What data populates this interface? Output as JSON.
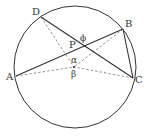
{
  "diagram": {
    "type": "inscribed-angle-geometry",
    "circle": {
      "cx": 75,
      "cy": 67,
      "r": 61
    },
    "center": {
      "x": 74,
      "y": 67
    },
    "points": [
      {
        "name": "D",
        "x": 41,
        "y": 17,
        "label": "D",
        "lx": 32,
        "ly": 15
      },
      {
        "name": "B",
        "x": 123,
        "y": 29,
        "label": "B",
        "lx": 125,
        "ly": 27
      },
      {
        "name": "A",
        "x": 16,
        "y": 76,
        "label": "A",
        "lx": 6,
        "ly": 80
      },
      {
        "name": "C",
        "x": 133,
        "y": 78,
        "label": "C",
        "lx": 135,
        "ly": 83
      },
      {
        "name": "P",
        "x": 81,
        "y": 46,
        "label": "P",
        "lx": 69,
        "ly": 48
      }
    ],
    "solid_lines": [
      [
        "D",
        "C"
      ],
      [
        "A",
        "B"
      ],
      [
        "B",
        "C"
      ]
    ],
    "dashed_lines": [
      [
        "D",
        "O"
      ],
      [
        "B",
        "O"
      ],
      [
        "A",
        "O"
      ],
      [
        "C",
        "O"
      ]
    ],
    "angle_labels": {
      "phi": "ϕ",
      "alpha": "α",
      "beta": "β"
    },
    "colors": {
      "stroke": "#333333",
      "dashed": "#777777"
    }
  }
}
